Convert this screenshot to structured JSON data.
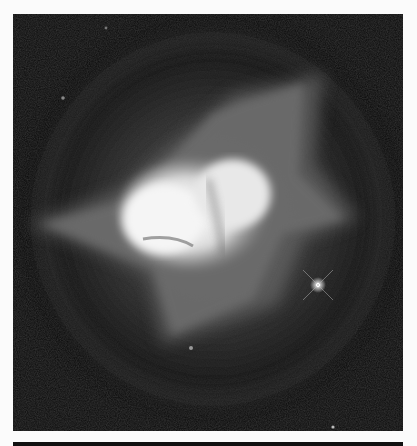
{
  "image": {
    "subject": "planetary nebula",
    "colors": {
      "background": "#fbfbfb",
      "sky": "#0a0a0a",
      "halo": "#5a5a5a",
      "core": "#f2f2f2",
      "bar": "#111111"
    }
  }
}
